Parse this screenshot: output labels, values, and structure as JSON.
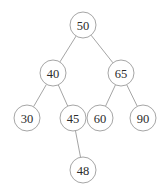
{
  "figure": {
    "background_color": "#ffffff",
    "node_fill_color": "#ffffff",
    "node_stroke_color": "#a6a6a6",
    "edge_color": "#9a9a9a",
    "label_color": "#2b2b2b",
    "node_radius": 13
  },
  "chart_data": {
    "type": "diagram",
    "diagram_kind": "binary-search-tree",
    "title": "",
    "xlabel": "",
    "ylabel": "",
    "grid": false,
    "legend": false,
    "nodes": [
      {
        "id": "n50",
        "label": "50",
        "value": 50,
        "cx": 83,
        "cy": 25,
        "r": 13,
        "level": 0
      },
      {
        "id": "n40",
        "label": "40",
        "value": 40,
        "cx": 53,
        "cy": 73,
        "r": 13,
        "level": 1
      },
      {
        "id": "n65",
        "label": "65",
        "value": 65,
        "cx": 121,
        "cy": 73,
        "r": 13,
        "level": 1
      },
      {
        "id": "n30",
        "label": "30",
        "value": 30,
        "cx": 27,
        "cy": 118,
        "r": 13,
        "level": 2
      },
      {
        "id": "n45",
        "label": "45",
        "value": 45,
        "cx": 73,
        "cy": 118,
        "r": 13,
        "level": 2
      },
      {
        "id": "n60",
        "label": "60",
        "value": 60,
        "cx": 100,
        "cy": 118,
        "r": 13,
        "level": 2
      },
      {
        "id": "n90",
        "label": "90",
        "value": 90,
        "cx": 143,
        "cy": 118,
        "r": 13,
        "level": 2
      },
      {
        "id": "n48",
        "label": "48",
        "value": 48,
        "cx": 83,
        "cy": 170,
        "r": 13,
        "level": 3
      }
    ],
    "edges": [
      {
        "from": "n50",
        "to": "n40",
        "side": "left"
      },
      {
        "from": "n50",
        "to": "n65",
        "side": "right"
      },
      {
        "from": "n40",
        "to": "n30",
        "side": "left"
      },
      {
        "from": "n40",
        "to": "n45",
        "side": "right"
      },
      {
        "from": "n65",
        "to": "n60",
        "side": "left"
      },
      {
        "from": "n65",
        "to": "n90",
        "side": "right"
      },
      {
        "from": "n45",
        "to": "n48",
        "side": "right"
      }
    ]
  }
}
